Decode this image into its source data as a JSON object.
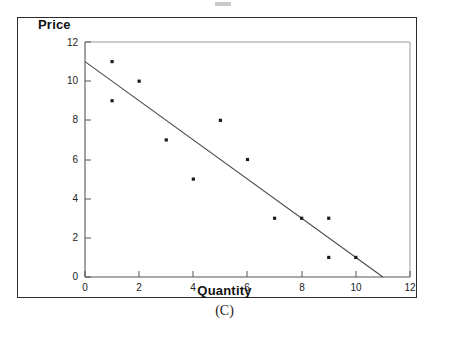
{
  "figure": {
    "caption": "(C)"
  },
  "chart_data": {
    "type": "scatter",
    "title": "",
    "xlabel": "Quantity",
    "ylabel": "Price",
    "xlim": [
      0,
      12
    ],
    "ylim": [
      0,
      12
    ],
    "xticks": [
      0,
      2,
      4,
      6,
      8,
      10,
      12
    ],
    "yticks": [
      0,
      2,
      4,
      6,
      8,
      10,
      12
    ],
    "xtick_labels": [
      "0",
      "2",
      "4",
      "6",
      "8",
      "10",
      "12"
    ],
    "ytick_labels": [
      "0",
      "2",
      "4",
      "6",
      "8",
      "10",
      "12"
    ],
    "grid": false,
    "legend": null,
    "points": [
      {
        "x": 1,
        "y": 11
      },
      {
        "x": 1,
        "y": 9
      },
      {
        "x": 2,
        "y": 10
      },
      {
        "x": 3,
        "y": 7
      },
      {
        "x": 4,
        "y": 5
      },
      {
        "x": 5,
        "y": 8
      },
      {
        "x": 6,
        "y": 6
      },
      {
        "x": 7,
        "y": 3
      },
      {
        "x": 8,
        "y": 3
      },
      {
        "x": 9,
        "y": 3
      },
      {
        "x": 9,
        "y": 1
      },
      {
        "x": 10,
        "y": 1
      }
    ],
    "series": [
      {
        "name": "trend-line",
        "type": "line",
        "x": [
          0,
          11
        ],
        "y": [
          11,
          0
        ]
      }
    ],
    "colors": {
      "point": "#1a1a1a",
      "line": "#4a4a4a",
      "axis": "#5a5a5a",
      "frame": "#2b2b2b",
      "text": "#111111"
    }
  }
}
